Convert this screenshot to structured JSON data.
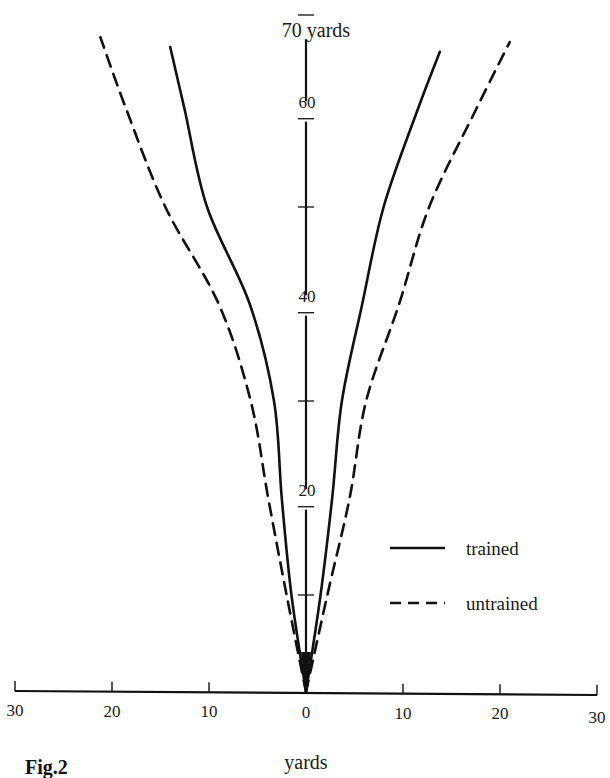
{
  "chart_data": {
    "type": "line",
    "title": "",
    "caption": "Fig.2",
    "xlabel": "yards",
    "ylabel": "yards",
    "y_axis_top_label": "70 yards",
    "x_ticks": [
      "30",
      "20",
      "10",
      "0",
      "10",
      "20",
      "30"
    ],
    "x_tick_values": [
      -30,
      -20,
      -10,
      0,
      10,
      20,
      30
    ],
    "y_ticks_labeled": [
      "20",
      "40",
      "60"
    ],
    "y_tick_values": [
      10,
      20,
      30,
      40,
      50,
      60,
      70
    ],
    "xlim": [
      -30,
      30
    ],
    "ylim": [
      0,
      70
    ],
    "grid": false,
    "legend_position": "lower right",
    "series": [
      {
        "name": "trained",
        "style": "solid",
        "left": [
          [
            0,
            0
          ],
          [
            -1.5,
            10
          ],
          [
            -2.5,
            20
          ],
          [
            -3.3,
            30
          ],
          [
            -5.8,
            40
          ],
          [
            -10.2,
            50
          ],
          [
            -12.5,
            60
          ],
          [
            -14.0,
            66.5
          ]
        ],
        "right": [
          [
            0,
            0
          ],
          [
            1.5,
            10
          ],
          [
            2.7,
            20
          ],
          [
            3.7,
            30
          ],
          [
            5.8,
            40
          ],
          [
            8.0,
            50
          ],
          [
            11.5,
            60
          ],
          [
            13.8,
            66
          ]
        ]
      },
      {
        "name": "untrained",
        "style": "dashed",
        "left": [
          [
            0,
            0
          ],
          [
            -2.0,
            10
          ],
          [
            -3.9,
            20
          ],
          [
            -5.7,
            30
          ],
          [
            -9.0,
            40
          ],
          [
            -14.5,
            50
          ],
          [
            -18.5,
            60
          ],
          [
            -21.2,
            67.5
          ]
        ],
        "right": [
          [
            0,
            0
          ],
          [
            2.2,
            10
          ],
          [
            4.5,
            20
          ],
          [
            6.2,
            30
          ],
          [
            9.6,
            40
          ],
          [
            12.7,
            50
          ],
          [
            17.5,
            60
          ],
          [
            21.0,
            67
          ]
        ]
      }
    ]
  },
  "legend": {
    "items": [
      {
        "label": "trained",
        "style": "solid"
      },
      {
        "label": "untrained",
        "style": "dashed"
      }
    ]
  },
  "colors": {
    "ink": "#111111",
    "background": "#ffffff"
  }
}
